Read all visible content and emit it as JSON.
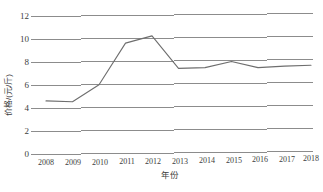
{
  "chart_data": {
    "type": "line",
    "title": "",
    "xlabel": "年份",
    "ylabel": "价格/(元/斤)",
    "categories": [
      "2008",
      "2009",
      "2010",
      "2011",
      "2012",
      "2013",
      "2014",
      "2015",
      "2016",
      "2017",
      "2018"
    ],
    "series": [
      {
        "name": "价格",
        "values": [
          4.65,
          4.55,
          6.0,
          9.6,
          10.2,
          7.35,
          7.4,
          7.9,
          7.35,
          7.45,
          7.5
        ]
      }
    ],
    "ylim": [
      0,
      12
    ],
    "yticks": [
      0,
      2,
      4,
      6,
      8,
      10,
      12
    ],
    "ytick_labels": [
      "0",
      "2",
      "4",
      "6",
      "8",
      "10",
      "12"
    ],
    "xlim": [
      "2008",
      "2018"
    ],
    "grid": "horizontal",
    "legend": "none",
    "line_color": "#6e6e6e",
    "grid_color": "#808080",
    "background": "#ffffff"
  }
}
